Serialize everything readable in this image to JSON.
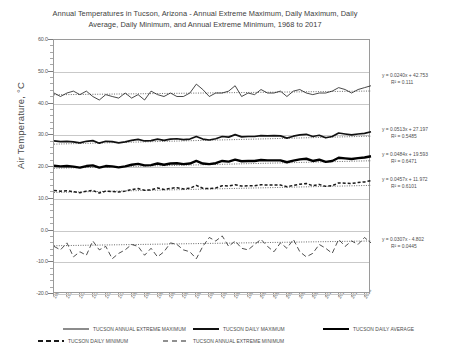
{
  "chart_data": {
    "type": "line",
    "title": "Annual Temperatures in Tucson, Arizona - Annual Extreme Maximum, Daily Maximum, Daily Average, Daily Minimum, and Annual Extreme Minimum, 1968 to 2017",
    "title_line1": "Annual Temperatures in Tucson, Arizona - Annual Extreme Maximum, Daily Maximum,",
    "title_line2": "Daily Average, Daily Minimum, and Annual Extreme Minimum, 1968 to 2017",
    "xlabel": "",
    "ylabel": "Air Temperature, °C",
    "ylim": [
      -20,
      60
    ],
    "yticks": [
      "60.0",
      "50.0",
      "40.0",
      "30.0",
      "20.0",
      "10.0",
      "0.0",
      "-10.0",
      "-20.0"
    ],
    "yminor_step": 2,
    "grid": true,
    "legend_position": "bottom",
    "xlim": [
      1968,
      2017
    ],
    "x": [
      1968,
      1969,
      1970,
      1971,
      1972,
      1973,
      1974,
      1975,
      1976,
      1977,
      1978,
      1979,
      1980,
      1981,
      1982,
      1983,
      1984,
      1985,
      1986,
      1987,
      1988,
      1989,
      1990,
      1991,
      1992,
      1993,
      1994,
      1995,
      1996,
      1997,
      1998,
      1999,
      2000,
      2001,
      2002,
      2003,
      2004,
      2005,
      2006,
      2007,
      2008,
      2009,
      2010,
      2011,
      2012,
      2013,
      2014,
      2015,
      2016,
      2017
    ],
    "xticks": [
      "1968",
      "1970",
      "1972",
      "1974",
      "1976",
      "1978",
      "1980",
      "1982",
      "1984",
      "1986",
      "1988",
      "1990",
      "1992",
      "1994",
      "1996",
      "1998",
      "2000",
      "2002",
      "2004",
      "2006",
      "2008",
      "2010",
      "2012",
      "2014",
      "2016"
    ],
    "series": [
      {
        "name": "TUCSON ANNUAL EXTREME MAXIMUM",
        "style": "thin-solid",
        "color": "#1a1a1a",
        "width": 0.8,
        "trend": {
          "equation": "y = 0.0240x + 42.753",
          "r2": "R² = 0.111",
          "slope": 0.024,
          "intercept": 42.753
        },
        "values": [
          43.3,
          42.2,
          43.3,
          43.9,
          42.8,
          43.9,
          42.2,
          41.1,
          42.8,
          42.2,
          41.7,
          43.3,
          41.7,
          42.8,
          41.1,
          43.9,
          42.8,
          42.2,
          43.3,
          42.2,
          42.2,
          43.3,
          46.1,
          44.4,
          42.2,
          43.3,
          43.3,
          43.9,
          45.6,
          42.2,
          43.3,
          42.8,
          44.4,
          43.3,
          43.3,
          43.9,
          42.2,
          43.9,
          44.4,
          43.3,
          42.8,
          43.3,
          43.3,
          43.9,
          45.0,
          44.4,
          43.3,
          44.4,
          45.0,
          45.6
        ]
      },
      {
        "name": "TUCSON DAILY MAXIMUM",
        "style": "thick-solid",
        "color": "#111111",
        "width": 1.7,
        "trend": {
          "equation": "y = 0.0513x + 27.197",
          "r2": "R² = 0.5485",
          "slope": 0.0513,
          "intercept": 27.197
        },
        "values": [
          28.2,
          28.0,
          28.1,
          27.9,
          27.6,
          28.1,
          28.3,
          27.5,
          28.1,
          28.0,
          27.6,
          27.9,
          28.4,
          28.7,
          28.2,
          28.3,
          28.8,
          28.4,
          28.8,
          28.9,
          28.6,
          28.8,
          29.6,
          28.8,
          28.5,
          28.9,
          29.6,
          29.4,
          30.2,
          29.5,
          29.6,
          29.6,
          29.9,
          29.8,
          29.9,
          29.8,
          29.1,
          29.7,
          30.1,
          30.3,
          29.6,
          30.0,
          29.2,
          29.6,
          30.7,
          30.4,
          30.1,
          30.4,
          30.6,
          31.1
        ]
      },
      {
        "name": "TUCSON DAILY AVERAGE",
        "style": "thickest-solid",
        "color": "#000000",
        "width": 2.4,
        "trend": {
          "equation": "y = 0.0484x + 19.593",
          "r2": "R² = 0.6471",
          "slope": 0.0484,
          "intercept": 19.593
        },
        "values": [
          20.4,
          20.2,
          20.3,
          20.1,
          19.8,
          20.3,
          20.5,
          19.8,
          20.3,
          20.2,
          19.9,
          20.2,
          20.7,
          21.0,
          20.5,
          20.6,
          21.1,
          20.7,
          21.1,
          21.2,
          20.9,
          21.1,
          21.9,
          21.1,
          20.9,
          21.2,
          21.9,
          21.7,
          22.3,
          21.8,
          21.9,
          21.9,
          22.2,
          22.1,
          22.1,
          22.1,
          21.5,
          22.0,
          22.4,
          22.6,
          21.9,
          22.3,
          21.6,
          21.9,
          22.9,
          22.7,
          22.5,
          22.8,
          23.0,
          23.4
        ]
      },
      {
        "name": "TUCSON DAILY MINIMUM",
        "style": "short-dash",
        "color": "#1a1a1a",
        "width": 1.5,
        "trend": {
          "equation": "y = 0.0457x + 11.972",
          "r2": "R² = 0.6101",
          "slope": 0.0457,
          "intercept": 11.972
        },
        "values": [
          12.6,
          12.4,
          12.5,
          12.2,
          11.9,
          12.4,
          12.6,
          11.8,
          12.4,
          12.3,
          12.1,
          12.4,
          12.9,
          13.2,
          12.7,
          12.8,
          13.4,
          12.9,
          13.3,
          13.5,
          13.1,
          13.3,
          14.2,
          13.3,
          13.2,
          13.4,
          14.1,
          14.0,
          14.4,
          14.0,
          14.1,
          14.1,
          14.4,
          14.3,
          14.3,
          14.3,
          13.8,
          14.2,
          14.6,
          14.8,
          14.1,
          14.5,
          13.9,
          14.1,
          15.0,
          14.9,
          14.8,
          15.1,
          15.3,
          15.7
        ]
      },
      {
        "name": "TUCSON ANNUAL EXTREME MINIMUM",
        "style": "long-dash",
        "color": "#222222",
        "width": 0.8,
        "trend": {
          "equation": "y = 0.0307x - 4.802",
          "r2": "R² = 0.0445",
          "slope": 0.0307,
          "intercept": -4.802
        },
        "values": [
          -5.0,
          -6.1,
          -3.9,
          -8.3,
          -6.7,
          -7.8,
          -3.3,
          -6.1,
          -5.0,
          -8.9,
          -7.2,
          -6.1,
          -4.4,
          -5.0,
          -7.8,
          -5.6,
          -8.3,
          -6.7,
          -3.9,
          -4.4,
          -6.1,
          -6.7,
          -8.9,
          -5.0,
          -2.2,
          -3.3,
          -1.7,
          -5.0,
          -3.3,
          -5.6,
          -6.1,
          -4.4,
          -2.8,
          -5.0,
          -6.7,
          -3.9,
          -5.6,
          -2.8,
          -6.7,
          -8.3,
          -7.2,
          -4.4,
          -5.6,
          -7.2,
          -2.8,
          -5.0,
          -3.3,
          -4.4,
          -2.2,
          -3.9
        ]
      }
    ]
  }
}
